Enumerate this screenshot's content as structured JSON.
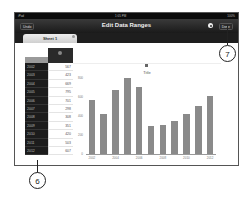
{
  "status_bar": {
    "carrier": "iPad",
    "time": "1:05 PM",
    "battery": "100%"
  },
  "nav_bar": {
    "left_button": "Undo",
    "title": "Edit Data Ranges",
    "right_button": "Done"
  },
  "tabs": [
    {
      "label": "Sheet 1"
    }
  ],
  "table": {
    "rows": [
      {
        "year": "2002",
        "value": "567"
      },
      {
        "year": "2003",
        "value": "423"
      },
      {
        "year": "2004",
        "value": "669"
      },
      {
        "year": "2005",
        "value": "795"
      },
      {
        "year": "2006",
        "value": "701"
      },
      {
        "year": "2007",
        "value": "298"
      },
      {
        "year": "2008",
        "value": "308"
      },
      {
        "year": "2009",
        "value": "351"
      },
      {
        "year": "2010",
        "value": "420"
      },
      {
        "year": "2011",
        "value": "503"
      },
      {
        "year": "2012",
        "value": "607"
      }
    ]
  },
  "chart_data": {
    "type": "bar",
    "title": "Title",
    "categories": [
      "2002",
      "2003",
      "2004",
      "2005",
      "2006",
      "2007",
      "2008",
      "2009",
      "2010",
      "2011",
      "2012"
    ],
    "values": [
      567,
      423,
      669,
      795,
      701,
      298,
      308,
      351,
      420,
      503,
      607
    ],
    "xtick_labels": [
      "2002",
      "2004",
      "2006",
      "2008",
      "2010",
      "2012"
    ],
    "ytick_labels": [
      "800",
      "600",
      "400",
      "200",
      "0"
    ],
    "xlabel": "",
    "ylabel": "",
    "ylim": [
      0,
      800
    ],
    "grid": false,
    "legend": "none"
  },
  "callouts": [
    {
      "label": "6"
    },
    {
      "label": "7"
    }
  ]
}
